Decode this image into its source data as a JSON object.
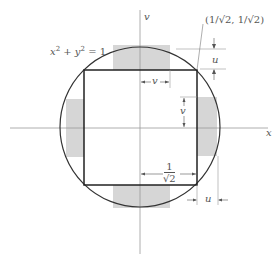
{
  "diagram": {
    "equation_label": "x² + y² = 1",
    "equation_x": "x",
    "equation_plus": " + ",
    "equation_y": "y",
    "equation_rhs": " = 1",
    "axis_x_label": "x",
    "axis_y_label": "v",
    "corner_point_label": "(1/√2, 1/√2)",
    "dim_u_top": "u",
    "dim_u_bottom": "u",
    "dim_v_horizontal": "v",
    "dim_v_vertical": "v",
    "half_side_numerator": "1",
    "half_side_denominator": "√2",
    "colors": {
      "stroke": "#333333",
      "axis": "#9a9a9a",
      "shade": "#d6d6d6",
      "text": "#555555"
    }
  }
}
